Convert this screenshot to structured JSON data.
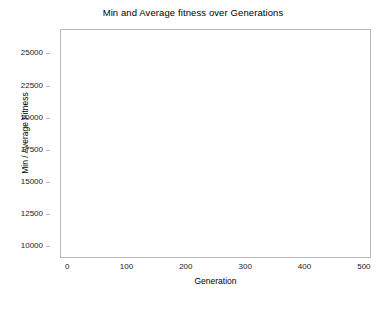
{
  "chart_data": {
    "type": "line",
    "title": "Min and Average fitness over Generations",
    "xlabel": "Generation",
    "ylabel": "Min / Average Fitness",
    "xlim": [
      -12,
      512
    ],
    "ylim": [
      9100,
      26900
    ],
    "xticks": [
      0,
      100,
      200,
      300,
      400,
      500
    ],
    "yticks": [
      10000,
      12500,
      15000,
      17500,
      20000,
      22500,
      25000
    ],
    "grid": true,
    "legend": "none",
    "background": "#ffffff",
    "grid_color": "#d6d6d6",
    "axis_color": "#b9b9b9",
    "series": [
      {
        "name": "Average Fitness",
        "color": "#4a4a4a",
        "linewidth": 1.1,
        "x": [
          0,
          2,
          4,
          6,
          8,
          10,
          12,
          14,
          16,
          18,
          20,
          22,
          24,
          26,
          28,
          30,
          32,
          34,
          36,
          38,
          40,
          42,
          44,
          46,
          48,
          50,
          52,
          54,
          56,
          58,
          60,
          62,
          64,
          66,
          68,
          70,
          72,
          74,
          76,
          78,
          80,
          82,
          84,
          86,
          88,
          90,
          92,
          94,
          96,
          98,
          100,
          104,
          108,
          112,
          116,
          120,
          124,
          128,
          132,
          136,
          140,
          145,
          150,
          155,
          160,
          163,
          166,
          170,
          175,
          180,
          185,
          190,
          195,
          200,
          210,
          220,
          230,
          240,
          250,
          260,
          270,
          280,
          290,
          300,
          310,
          320,
          330,
          340,
          350,
          360,
          370,
          380,
          390,
          400,
          410,
          420,
          430,
          440,
          450,
          460,
          470,
          480,
          490,
          500
        ],
        "y": [
          26350,
          25100,
          24050,
          23150,
          22400,
          21750,
          21200,
          20700,
          20300,
          19950,
          19650,
          19350,
          19050,
          18800,
          18550,
          18300,
          18050,
          17800,
          17600,
          17400,
          17200,
          17000,
          16800,
          16600,
          16400,
          16150,
          15900,
          15700,
          15500,
          15300,
          15100,
          14850,
          14700,
          14550,
          14350,
          14150,
          14000,
          13850,
          13700,
          13550,
          13400,
          13250,
          13150,
          13050,
          12900,
          12750,
          12600,
          12450,
          12300,
          12150,
          12000,
          11750,
          11500,
          11200,
          10950,
          10720,
          10520,
          10380,
          10250,
          10130,
          10030,
          9960,
          9930,
          9930,
          10000,
          10160,
          10050,
          9950,
          9920,
          9900,
          9890,
          9880,
          9890,
          9880,
          9875,
          9885,
          9870,
          9880,
          9875,
          9870,
          9880,
          9870,
          9875,
          9865,
          9875,
          9870,
          9865,
          9875,
          9865,
          9870,
          9865,
          9870,
          9860,
          9870,
          9865,
          9860,
          9870,
          9860,
          9865,
          9860,
          9865,
          9860,
          9860,
          9860
        ]
      },
      {
        "name": "Min Fitness",
        "color": "#4a4a4a",
        "linewidth": 1.1,
        "x": [
          0,
          1,
          2,
          3,
          4,
          5,
          6,
          7,
          8,
          9,
          10,
          11,
          12,
          13,
          14,
          15,
          16,
          17,
          18,
          19,
          20,
          21,
          22,
          23,
          24,
          25,
          26,
          27,
          28,
          29,
          30,
          32,
          34,
          36,
          38,
          40,
          41,
          42,
          43,
          44,
          46,
          48,
          50,
          52,
          54,
          56,
          58,
          60,
          62,
          64,
          66,
          68,
          70,
          72,
          74,
          76,
          78,
          80,
          82,
          85,
          90,
          95,
          100,
          110,
          120,
          130,
          140,
          150,
          160,
          170,
          180,
          190,
          200,
          210,
          220,
          230,
          240,
          250,
          260,
          270,
          280,
          290,
          300,
          310,
          320,
          330,
          340,
          350,
          360,
          370,
          380,
          390,
          400,
          410,
          420,
          430,
          440,
          450,
          460,
          470,
          480,
          490,
          500
        ],
        "y": [
          21050,
          21050,
          19750,
          19750,
          19500,
          19500,
          18300,
          18300,
          17100,
          17100,
          16900,
          16900,
          16750,
          16750,
          16500,
          16100,
          15900,
          15900,
          15800,
          15650,
          15400,
          15400,
          14900,
          14900,
          13200,
          13200,
          12900,
          12900,
          12600,
          12600,
          12500,
          12400,
          12350,
          12300,
          12250,
          12150,
          11350,
          11350,
          11300,
          11300,
          11250,
          11200,
          11150,
          11100,
          10950,
          10950,
          10850,
          10800,
          10750,
          10700,
          10550,
          10500,
          10350,
          10300,
          10100,
          10050,
          9950,
          9880,
          9850,
          9830,
          9830,
          9825,
          9820,
          9820,
          9815,
          9815,
          9810,
          9810,
          9810,
          9805,
          9805,
          9800,
          9800,
          9800,
          9795,
          9795,
          9790,
          9790,
          9790,
          9785,
          9785,
          9785,
          9780,
          9780,
          9780,
          9780,
          9775,
          9775,
          9775,
          9775,
          9770,
          9770,
          9770,
          9770,
          9765,
          9765,
          9765,
          9765,
          9760,
          9760,
          9760,
          9760,
          9760
        ]
      }
    ]
  }
}
